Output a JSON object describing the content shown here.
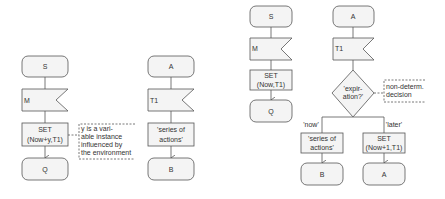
{
  "diagrams": [
    {
      "start": "S",
      "input": "M",
      "task_line1": "SET",
      "task_line2": "(Now+y,T1)",
      "end": "Q",
      "comment": [
        "y is a vari-",
        "able instance",
        "influenced by",
        "the environment"
      ]
    },
    {
      "start": "A",
      "input": "T1",
      "task_line1": "'series of",
      "task_line2": "actions'",
      "end": "B"
    },
    {
      "start": "S",
      "input": "M",
      "task_line1": "SET",
      "task_line2": "(Now,T1)",
      "end": "Q"
    },
    {
      "start": "A",
      "input": "T1",
      "decision_line1": "'expir-",
      "decision_line2": "ation?'",
      "comment": [
        "non-determ.",
        "decision"
      ],
      "branch_left_label": "'now'",
      "branch_right_label": "'later'",
      "left_task_line1": "'series of",
      "left_task_line2": "actions'",
      "right_task_line1": "SET",
      "right_task_line2": "(Now+1,T1)",
      "left_end": "B",
      "right_end": "A"
    }
  ],
  "colors": {
    "stroke": "#555555",
    "fill": "#f4f4f4",
    "text": "#333333"
  }
}
